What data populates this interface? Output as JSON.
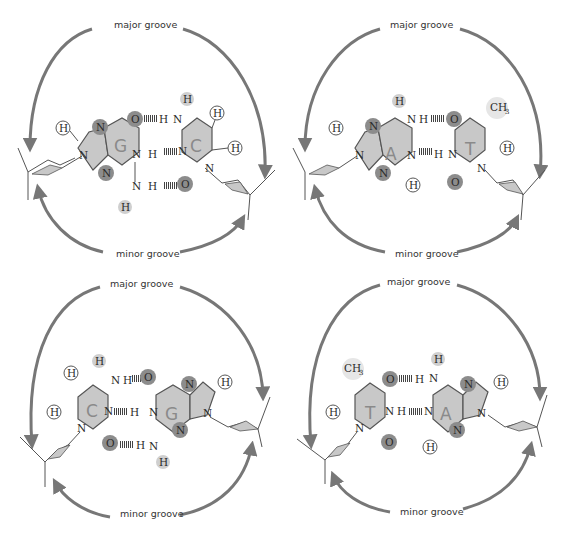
{
  "figure": {
    "colors": {
      "ring_fill": "#c8c8c8",
      "ring_stroke": "#555555",
      "acceptor_dark": "#8c8c8c",
      "donor_light": "#cfcfcf",
      "arrow": "#777777",
      "sugar_fill": "#c8c8c8",
      "text": "#333333"
    }
  },
  "panels": [
    {
      "id": "gc",
      "name": "G-C pair",
      "major_label": "major groove",
      "minor_label": "minor groove",
      "left_base": "G",
      "right_base": "C",
      "bonds": [
        "O·H–N",
        "N–H·N",
        "N–H·O"
      ]
    },
    {
      "id": "at",
      "name": "A-T pair",
      "major_label": "major groove",
      "minor_label": "minor groove",
      "left_base": "A",
      "right_base": "T",
      "methyl": "CH3",
      "bonds": [
        "N–H·O",
        "N·H–N"
      ]
    },
    {
      "id": "cg",
      "name": "C-G pair",
      "major_label": "major groove",
      "minor_label": "minor groove",
      "left_base": "C",
      "right_base": "G",
      "bonds": [
        "N–H·O",
        "N·H–N",
        "O·H–N"
      ]
    },
    {
      "id": "ta",
      "name": "T-A pair",
      "major_label": "major groove",
      "minor_label": "minor groove",
      "left_base": "T",
      "right_base": "A",
      "methyl": "CH3",
      "bonds": [
        "O·H–N",
        "N–H·N"
      ]
    }
  ],
  "atoms": {
    "H": "H",
    "N": "N",
    "O": "O",
    "CH3_main": "CH",
    "CH3_sub": "3"
  }
}
